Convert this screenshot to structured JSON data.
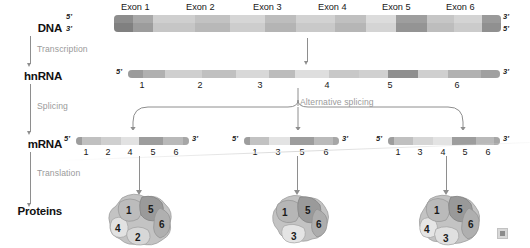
{
  "figure": {
    "watermark": "watermark-icon"
  },
  "stages": [
    {
      "id": "dna",
      "label": "DNA"
    },
    {
      "id": "hnrna",
      "label": "hnRNA"
    },
    {
      "id": "mrna",
      "label": "mRNA"
    },
    {
      "id": "proteins",
      "label": "Proteins"
    }
  ],
  "steps": [
    {
      "id": "transcription",
      "label": "Transcription"
    },
    {
      "id": "splicing",
      "label": "Splicing"
    },
    {
      "id": "translation",
      "label": "Translation"
    }
  ],
  "alternative_splicing": {
    "label": "Alternative splicing"
  },
  "dna": {
    "five_prime_top": "5'",
    "three_prime_top": "3'",
    "five_prime_end": "5'",
    "three_prime_end": "3'",
    "exon_labels": [
      "Exon 1",
      "Exon 2",
      "Exon 3",
      "Exon 4",
      "Exon 5",
      "Exon 6"
    ]
  },
  "hnrna": {
    "five_prime": "5'",
    "three_prime": "3'",
    "exon_numbers": [
      "1",
      "2",
      "3",
      "4",
      "5",
      "6"
    ]
  },
  "mrna_variants": [
    {
      "id": "mrna-variant-1",
      "five_prime": "5'",
      "three_prime": "3'",
      "exon_numbers": [
        "1",
        "2",
        "4",
        "5",
        "6"
      ]
    },
    {
      "id": "mrna-variant-2",
      "five_prime": "5'",
      "three_prime": "3'",
      "exon_numbers": [
        "1",
        "3",
        "5",
        "6"
      ]
    },
    {
      "id": "mrna-variant-3",
      "five_prime": "5'",
      "three_prime": "3'",
      "exon_numbers": [
        "1",
        "3",
        "4",
        "5",
        "6"
      ]
    }
  ],
  "proteins": [
    {
      "id": "protein-1",
      "domains": [
        "1",
        "5",
        "6",
        "4",
        "2"
      ]
    },
    {
      "id": "protein-2",
      "domains": [
        "1",
        "5",
        "6",
        "3"
      ]
    },
    {
      "id": "protein-3",
      "domains": [
        "1",
        "5",
        "6",
        "4",
        "3"
      ]
    }
  ],
  "colors": {
    "exon_dark": "#9a9a9a",
    "exon_mid": "#b4b4b4",
    "exon_light": "#d9d9d9",
    "intron": "#c9c9c9",
    "arrow": "#8e8e8e",
    "step_text": "#9a9a9a",
    "stage_text": "#111111"
  }
}
